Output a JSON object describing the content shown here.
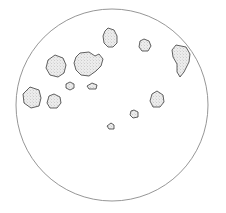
{
  "figure": {
    "type": "scatter-diagram",
    "background_color": "#ffffff",
    "canvas": {
      "width": 226,
      "height": 213
    }
  },
  "field": {
    "label": "field-of-view-circle",
    "center_x": 112,
    "center_y": 105,
    "radius": 96,
    "stroke_color": "#8a8a8a",
    "fill_color": "none",
    "stroke_width": 0.9
  },
  "particle_style": {
    "outline_color": "#3a3a3a",
    "fill_color": "#ededed",
    "stipple_color": "#9a9a9a",
    "outline_width": 0.8,
    "texture": "stipple"
  },
  "chart_data": {
    "type": "scatter",
    "xlabel": "",
    "ylabel": "",
    "xlim": [
      16,
      208
    ],
    "ylim": [
      9,
      201
    ],
    "grid": false,
    "legend": "none",
    "count": 14,
    "particles": [
      {
        "id": "p1",
        "name": "particle-top-center",
        "cx": 110,
        "cy": 38,
        "size": "medium",
        "width": 16,
        "height": 21,
        "path": "M108,28 L114,30 L117,36 L117,43 L113,47 L108,47 L104,43 L103,36 L105,31 Z"
      },
      {
        "id": "p2",
        "name": "particle-upper-right-small",
        "cx": 145,
        "cy": 45,
        "size": "small",
        "width": 12,
        "height": 13,
        "path": "M144,39 L149,41 L151,46 L148,51 L142,51 L139,47 L140,41 Z"
      },
      {
        "id": "p3",
        "name": "particle-right-teardrop",
        "cx": 181,
        "cy": 60,
        "size": "large",
        "width": 19,
        "height": 32,
        "path": "M176,45 L186,47 L190,54 L189,62 L184,72 L180,77 L177,72 L177,64 L173,57 L172,50 Z"
      },
      {
        "id": "p4",
        "name": "particle-upper-left-oval",
        "cx": 56,
        "cy": 66,
        "size": "medium",
        "width": 20,
        "height": 21,
        "path": "M55,55 L63,58 L66,65 L64,73 L58,77 L50,75 L46,68 L48,60 Z"
      },
      {
        "id": "p5",
        "name": "particle-center-large-lobed",
        "cx": 87,
        "cy": 64,
        "size": "large",
        "width": 28,
        "height": 25,
        "path": "M80,53 L89,52 L95,56 L99,54 L103,59 L101,66 L96,71 L89,76 L81,75 L76,70 L74,63 L76,57 Z"
      },
      {
        "id": "p6",
        "name": "particle-left-pentagon",
        "cx": 32,
        "cy": 97,
        "size": "medium",
        "width": 18,
        "height": 20,
        "path": "M30,87 L39,90 L41,98 L39,106 L31,108 L24,103 L23,94 Z"
      },
      {
        "id": "p7",
        "name": "particle-left-small-round",
        "cx": 54,
        "cy": 101,
        "size": "small",
        "width": 15,
        "height": 15,
        "path": "M54,94 L60,97 L61,103 L57,108 L50,108 L47,103 L49,96 Z"
      },
      {
        "id": "p8",
        "name": "particle-mid-left-tiny",
        "cx": 70,
        "cy": 86,
        "size": "tiny",
        "width": 9,
        "height": 8,
        "path": "M70,82 L74,84 L74,88 L70,90 L66,88 L66,84 Z"
      },
      {
        "id": "p9",
        "name": "particle-mid-center-tiny",
        "cx": 92,
        "cy": 86,
        "size": "tiny",
        "width": 10,
        "height": 7,
        "path": "M92,83 L97,85 L96,89 L89,89 L87,86 Z"
      },
      {
        "id": "p10",
        "name": "particle-right-mid",
        "cx": 157,
        "cy": 99,
        "size": "medium",
        "width": 15,
        "height": 17,
        "path": "M157,91 L163,95 L164,102 L160,107 L153,107 L150,101 L152,94 Z"
      },
      {
        "id": "p11",
        "name": "particle-lower-center-tiny",
        "cx": 134,
        "cy": 114,
        "size": "tiny",
        "width": 9,
        "height": 9,
        "path": "M134,110 L138,112 L138,117 L133,118 L130,115 L131,111 Z"
      },
      {
        "id": "p12",
        "name": "particle-lower-left-tiny",
        "cx": 111,
        "cy": 126,
        "size": "tiny",
        "width": 8,
        "height": 7,
        "path": "M111,123 L114,125 L114,129 L109,129 L107,126 Z"
      },
      {
        "id": "p13",
        "name": "particle-upper-left-edge",
        "cx": 49,
        "cy": 60,
        "size": "tiny",
        "width": 0,
        "height": 0,
        "path": ""
      },
      {
        "id": "p14",
        "name": "particle-reserved",
        "cx": 0,
        "cy": 0,
        "size": "none",
        "width": 0,
        "height": 0,
        "path": ""
      }
    ]
  }
}
